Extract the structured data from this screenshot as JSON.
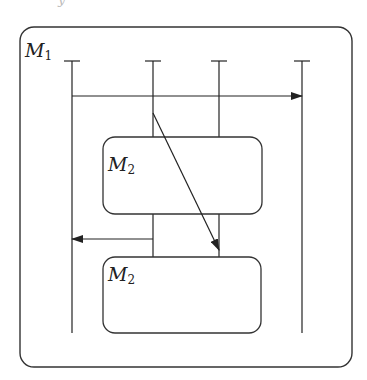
{
  "diagram": {
    "outer_module": {
      "label": "M",
      "subscript": "1"
    },
    "inner_modules": [
      {
        "label": "M",
        "subscript": "2"
      },
      {
        "label": "M",
        "subscript": "2"
      }
    ],
    "lifelines": 4,
    "messages": [
      {
        "from_lifeline": 1,
        "to_lifeline": 4,
        "direction": "right"
      },
      {
        "from_lifeline": 2,
        "to_lifeline": 3,
        "direction": "diagonal-down"
      },
      {
        "from_lifeline": 2,
        "to_lifeline": 1,
        "direction": "left"
      }
    ],
    "colors": {
      "stroke": "#222222",
      "background": "#ffffff"
    }
  }
}
